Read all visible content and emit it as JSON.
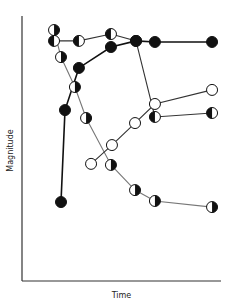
{
  "chart_data": {
    "type": "line",
    "title": "",
    "xlabel": "Time",
    "ylabel": "Magnitude",
    "xlim": [
      0,
      100
    ],
    "ylim": [
      0,
      100
    ],
    "grid": false,
    "legend": null,
    "ticks": {
      "x": [],
      "y": []
    },
    "series": [
      {
        "name": "filled",
        "marker": "filled-circle",
        "line_color": "#111111",
        "line_width": 1.6,
        "points": [
          [
            19.6,
            29.8
          ],
          [
            21.6,
            64.5
          ],
          [
            28.6,
            80.4
          ],
          [
            44.7,
            88.3
          ],
          [
            57.3,
            90.6
          ],
          [
            66.8,
            90.2
          ],
          [
            95.5,
            90.2
          ]
        ]
      },
      {
        "name": "half-filled-top",
        "marker": "half-circle-black-left",
        "line_color": "#333333",
        "line_width": 1.1,
        "points": [
          [
            16.1,
            90.6
          ],
          [
            28.6,
            90.6
          ],
          [
            44.7,
            93.2
          ],
          [
            57.3,
            90.6
          ],
          [
            66.8,
            61.9
          ],
          [
            95.5,
            63.4
          ]
        ]
      },
      {
        "name": "open",
        "marker": "open-circle",
        "line_color": "#333333",
        "line_width": 1.1,
        "points": [
          [
            34.7,
            44.2
          ],
          [
            45.2,
            51.3
          ],
          [
            56.8,
            59.6
          ],
          [
            66.8,
            66.8
          ],
          [
            95.5,
            72.1
          ]
        ]
      },
      {
        "name": "half-filled-descending",
        "marker": "half-circle-black-right",
        "line_color": "#777777",
        "line_width": 1.1,
        "points": [
          [
            16.1,
            94.7
          ],
          [
            19.6,
            84.5
          ],
          [
            26.6,
            73.2
          ],
          [
            32.2,
            61.5
          ],
          [
            44.7,
            43.8
          ],
          [
            56.8,
            34.3
          ],
          [
            66.8,
            30.2
          ],
          [
            95.5,
            27.9
          ]
        ]
      }
    ]
  },
  "axes": {
    "x_label": "Time",
    "y_label": "Magnitude"
  }
}
